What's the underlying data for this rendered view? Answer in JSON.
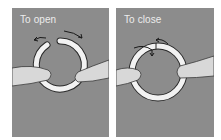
{
  "panels": [
    {
      "id": "open",
      "label": "To open"
    },
    {
      "id": "close",
      "label": "To close"
    }
  ],
  "colors": {
    "background": "#8c8c8c",
    "ring": "#f2f2f2",
    "ring_outline": "#2a2a2a",
    "fingers": "#d8d8d8",
    "label": "#ececec"
  }
}
